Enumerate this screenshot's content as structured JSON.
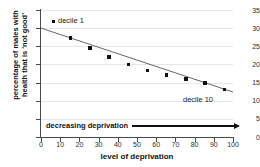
{
  "chart_data": {
    "type": "scatter",
    "title": "",
    "xlabel": "level of deprivation",
    "ylabel_line1": "percentage of males with",
    "ylabel_line2": "health that is 'not good'",
    "xlim": [
      0,
      100
    ],
    "ylim": [
      0,
      35
    ],
    "xticks": [
      0,
      10,
      20,
      30,
      40,
      50,
      60,
      70,
      80,
      90,
      100
    ],
    "yticks": [
      0,
      5,
      10,
      15,
      20,
      25,
      30,
      35
    ],
    "grid": "horizontal",
    "legend_position": "inside-top-left",
    "marker_color": "#111111",
    "trendline_color": "#555555",
    "x": [
      15.5,
      25.5,
      35.5,
      45.5,
      55.5,
      65.5,
      75.5,
      85.5,
      95.5
    ],
    "values": [
      27.3,
      24.5,
      22.0,
      19.9,
      18.4,
      17.1,
      16.0,
      14.9,
      13.1
    ],
    "trendline": {
      "x0": 0,
      "y0": 30.0,
      "x1": 100,
      "y1": 12.4
    },
    "annotations": [
      {
        "name": "decile-1",
        "text": "decile 1"
      },
      {
        "name": "decile-10",
        "text": "decile 10"
      },
      {
        "name": "deprivation-arrow",
        "text": "decreasing deprivation"
      }
    ]
  },
  "legend": {
    "decile_first": "decile 1",
    "decile_last": "decile 10"
  },
  "annotation": {
    "deprivation_label": "decreasing deprivation"
  }
}
